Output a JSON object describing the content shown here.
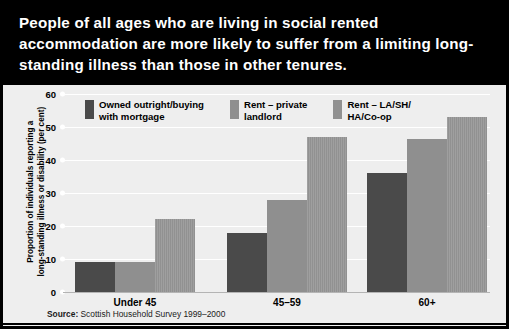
{
  "title": "People of all ages who are living in social rented accommodation are more likely to suffer from a limiting long-standing illness than those in other tenures.",
  "source": {
    "label": "Source:",
    "text": " Scottish Household Survey 1999–2000"
  },
  "colors": {
    "series_1": "#4a4a4a",
    "series_2": "#8f8f8f",
    "series_3": "#919191",
    "banner_background": "#000000",
    "banner_text": "#ffffff",
    "panel_background": "#eeeeee",
    "gridline": "#ffffff"
  },
  "chart_data": {
    "type": "bar",
    "title": "People of all ages who are living in social rented accommodation are more likely to suffer from a limiting long-standing illness than those in other tenures.",
    "xlabel": "",
    "ylabel": "Proportion of individuals reporting a long-standing illness or disability (per cent)",
    "ylabel_lines": [
      "Proportion of individuals reporting a",
      "long-standing illness or disability (per cent)"
    ],
    "categories": [
      "Under 45",
      "45–59",
      "60+"
    ],
    "series": [
      {
        "name": "Owned outright/buying with mortgage",
        "name_lines": [
          "Owned outright/buying",
          "with mortgage"
        ],
        "values": [
          9,
          18,
          36
        ]
      },
      {
        "name": "Rent – private landlord",
        "name_lines": [
          "Rent – private",
          "landlord"
        ],
        "values": [
          9,
          28,
          46.5
        ]
      },
      {
        "name": "Rent – LA/SH/HA/Co-op",
        "name_lines": [
          "Rent – LA/SH/",
          "HA/Co-op"
        ],
        "values": [
          22,
          47,
          53
        ]
      }
    ],
    "ylim": [
      0,
      60
    ],
    "yticks": [
      0,
      10,
      20,
      30,
      40,
      50,
      60
    ],
    "ytick_labels": [
      "0",
      "10",
      "20",
      "30",
      "40",
      "50",
      "60"
    ],
    "grid": true,
    "legend_position": "top-left"
  }
}
